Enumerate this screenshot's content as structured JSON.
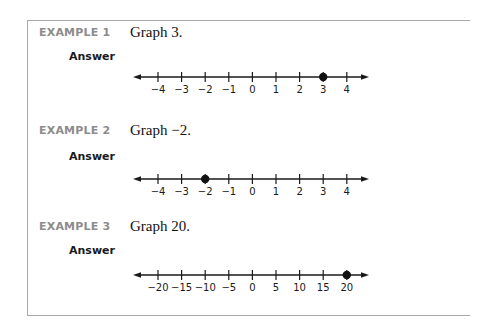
{
  "examples": [
    {
      "label": "EXAMPLE 1",
      "prompt": "Graph 3.",
      "answer_label": "Answer",
      "number_line": {
        "ticks": [
          "−4",
          "−3",
          "−2",
          "−1",
          "0",
          "1",
          "2",
          "3",
          "4"
        ],
        "values": [
          -4,
          -3,
          -2,
          -1,
          0,
          1,
          2,
          3,
          4
        ],
        "point": 3
      }
    },
    {
      "label": "EXAMPLE 2",
      "prompt": "Graph −2.",
      "answer_label": "Answer",
      "number_line": {
        "ticks": [
          "−4",
          "−3",
          "−2",
          "−1",
          "0",
          "1",
          "2",
          "3",
          "4"
        ],
        "values": [
          -4,
          -3,
          -2,
          -1,
          0,
          1,
          2,
          3,
          4
        ],
        "point": -2
      }
    },
    {
      "label": "EXAMPLE 3",
      "prompt": "Graph 20.",
      "answer_label": "Answer",
      "number_line": {
        "ticks": [
          "−20",
          "−15",
          "−10",
          "−5",
          "0",
          "5",
          "10",
          "15",
          "20"
        ],
        "values": [
          -20,
          -15,
          -10,
          -5,
          0,
          5,
          10,
          15,
          20
        ],
        "point": 20
      }
    }
  ],
  "colors": {
    "label": "#8c8c8c",
    "text": "#111111",
    "border": "#a8a8a8"
  }
}
